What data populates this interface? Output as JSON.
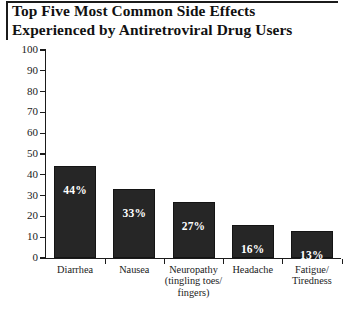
{
  "figure": {
    "title": "Top Five Most Common Side Effects\nExperienced by Antiretroviral Drug Users",
    "title_rule": "horizontal-rule",
    "background_color": "#ffffff",
    "bar_color": "#262626",
    "axis_color": "#1b1b1b",
    "value_label_color": "#ffffff"
  },
  "chart_data": {
    "type": "bar",
    "title": "Top Five Most Common Side Effects Experienced by Antiretroviral Drug Users",
    "xlabel": "",
    "ylabel": "",
    "ylim": [
      0,
      100
    ],
    "yticks": [
      0,
      10,
      20,
      30,
      40,
      50,
      60,
      70,
      80,
      90,
      100
    ],
    "ytick_labels": [
      "0",
      "10",
      "20",
      "30",
      "40",
      "50",
      "60",
      "70",
      "80",
      "90",
      "100"
    ],
    "grid": false,
    "legend": false,
    "categories": [
      "Diarrhea",
      "Nausea",
      "Neuropathy\n(tingling toes/\nfingers)",
      "Headache",
      "Fatigue/\nTiredness"
    ],
    "values": [
      44,
      33,
      27,
      16,
      13
    ],
    "data_labels": [
      "44%",
      "33%",
      "27%",
      "16%",
      "13%"
    ]
  }
}
